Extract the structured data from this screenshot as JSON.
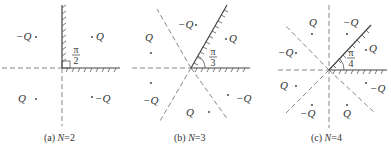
{
  "figure": {
    "panels": [
      {
        "id": "a",
        "caption_prefix": "(a) ",
        "caption_var": "N",
        "caption_value": "=2",
        "angle_num": "π",
        "angle_den": "2",
        "charges": [
          {
            "label": "−Q",
            "quadrant": "upper-left"
          },
          {
            "label": "Q",
            "quadrant": "upper-right"
          },
          {
            "label": "Q",
            "quadrant": "lower-left"
          },
          {
            "label": "−Q",
            "quadrant": "lower-right"
          }
        ]
      },
      {
        "id": "b",
        "caption_prefix": "(b) ",
        "caption_var": "N",
        "caption_value": "=3",
        "angle_num": "π",
        "angle_den": "3",
        "charges": [
          {
            "label": "−Q",
            "region": "top"
          },
          {
            "label": "Q",
            "region": "upper-right"
          },
          {
            "label": "Q",
            "region": "upper-left"
          },
          {
            "label": "−Q",
            "region": "lower-left"
          },
          {
            "label": "Q",
            "region": "bottom"
          },
          {
            "label": "−Q",
            "region": "lower-right"
          }
        ]
      },
      {
        "id": "c",
        "caption_prefix": "(c) ",
        "caption_var": "N",
        "caption_value": "=4",
        "angle_num": "π",
        "angle_den": "4",
        "charges": [
          {
            "label": "Q",
            "region": "top-left"
          },
          {
            "label": "−Q",
            "region": "top-right"
          },
          {
            "label": "−Q",
            "region": "left-upper"
          },
          {
            "label": "Q",
            "region": "right-upper"
          },
          {
            "label": "Q",
            "region": "left-lower"
          },
          {
            "label": "−Q",
            "region": "right-lower"
          },
          {
            "label": "−Q",
            "region": "bottom-left"
          },
          {
            "label": "Q",
            "region": "bottom-right"
          }
        ]
      }
    ]
  }
}
